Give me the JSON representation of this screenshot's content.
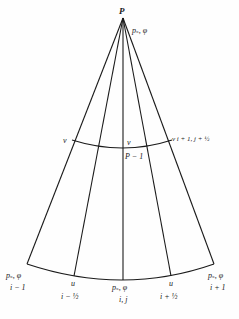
{
  "diagram": {
    "type": "polar-grid-cell",
    "apex_label": "P",
    "apex_var": "p_s, φ",
    "mid_arc": {
      "left_label": "v",
      "center_label": "v",
      "center_below": "P − 1",
      "right_label": "v_{i+1, j+½}",
      "right_display": "v i + 1, j + ½"
    },
    "bottom": {
      "left": {
        "var": "p_s, φ",
        "var_display": "pₛ, φ",
        "index": "i − 1"
      },
      "left_mid": {
        "var": "u",
        "index": "i − ½"
      },
      "center": {
        "var": "p_s, φ",
        "var_display": "pₛ, φ",
        "index": "i, j"
      },
      "right_mid": {
        "var": "u",
        "index": "i + ½"
      },
      "right": {
        "var": "p_s, φ",
        "var_display": "pₛ, φ",
        "index": "i + 1"
      }
    },
    "colors": {
      "line": "#1a1a1a",
      "background": "#fefefe"
    }
  }
}
